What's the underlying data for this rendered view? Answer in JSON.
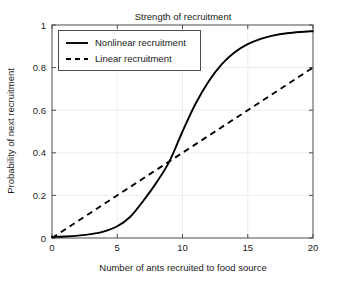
{
  "chart_data": {
    "type": "line",
    "title": "Strength of recruitment",
    "xlabel": "Number of ants recruited to food source",
    "ylabel": "Probability of next recruitment",
    "xlim": [
      0,
      20
    ],
    "ylim": [
      0,
      1
    ],
    "xticks": [
      0,
      5,
      10,
      15,
      20
    ],
    "xtick_labels": [
      "0",
      "5",
      "10",
      "15",
      "20"
    ],
    "yticks": [
      0,
      0.2,
      0.4,
      0.6,
      0.8,
      1
    ],
    "ytick_labels": [
      "0",
      "0.2",
      "0.4",
      "0.6",
      "0.8",
      "1"
    ],
    "grid": true,
    "legend_position": "upper left",
    "series": [
      {
        "name": "Nonlinear recruitment",
        "style": "solid",
        "color": "#000000",
        "x": [
          0,
          1,
          2,
          3,
          4,
          5,
          6,
          7,
          8,
          9,
          10,
          11,
          12,
          13,
          14,
          15,
          16,
          17,
          18,
          19,
          20
        ],
        "values": [
          0.005,
          0.007,
          0.011,
          0.018,
          0.031,
          0.055,
          0.1,
          0.175,
          0.26,
          0.36,
          0.5,
          0.63,
          0.735,
          0.815,
          0.872,
          0.91,
          0.935,
          0.951,
          0.961,
          0.967,
          0.971
        ]
      },
      {
        "name": "Linear recruitment",
        "style": "dashed",
        "color": "#000000",
        "x": [
          0,
          20
        ],
        "values": [
          0.0,
          0.8
        ]
      }
    ]
  },
  "legend": {
    "entries": [
      {
        "label": "Nonlinear recruitment",
        "style": "solid"
      },
      {
        "label": "Linear recruitment",
        "style": "dashed"
      }
    ]
  }
}
